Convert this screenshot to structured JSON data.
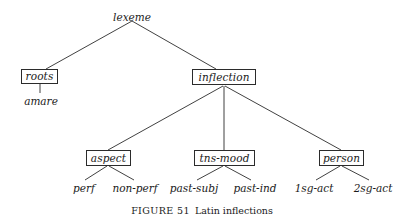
{
  "figure": {
    "caption_label": "FIGURE 51",
    "caption_title": "Latin inflections",
    "line_color": "#2b2b2b",
    "text_color": "#1a1a1a",
    "background": "#ffffff"
  },
  "tree": {
    "root": {
      "label": "lexeme",
      "x": 132,
      "y": 12
    },
    "boxes": [
      {
        "label": "roots",
        "x": 21,
        "y": 69,
        "w": 37,
        "h": 15
      },
      {
        "label": "inflection",
        "x": 192,
        "y": 69,
        "w": 64,
        "h": 16
      },
      {
        "label": "aspect",
        "x": 86,
        "y": 150,
        "w": 45,
        "h": 16
      },
      {
        "label": "tns-mood",
        "x": 194,
        "y": 150,
        "w": 61,
        "h": 16
      },
      {
        "label": "person",
        "x": 319,
        "y": 150,
        "w": 45,
        "h": 16
      }
    ],
    "leaves": [
      {
        "label": "amare",
        "x": 41,
        "y": 96
      },
      {
        "label": "perf",
        "x": 84,
        "y": 183
      },
      {
        "label": "non-perf",
        "x": 135,
        "y": 183
      },
      {
        "label": "past-subj",
        "x": 194,
        "y": 183
      },
      {
        "label": "past-ind",
        "x": 255,
        "y": 183
      },
      {
        "label": "1sg-act",
        "x": 314,
        "y": 183
      },
      {
        "label": "2sg-act",
        "x": 373,
        "y": 183
      }
    ],
    "edges": [
      {
        "from": "lexeme",
        "to": "roots",
        "x1": 132,
        "y1": 21,
        "x2": 46,
        "y2": 69
      },
      {
        "from": "lexeme",
        "to": "inflection",
        "x1": 132,
        "y1": 21,
        "x2": 216,
        "y2": 69
      },
      {
        "from": "roots",
        "to": "amare",
        "x1": 40,
        "y1": 84,
        "x2": 40,
        "y2": 93
      },
      {
        "from": "inflection",
        "to": "aspect",
        "x1": 223,
        "y1": 86,
        "x2": 108,
        "y2": 150
      },
      {
        "from": "inflection",
        "to": "tns-mood",
        "x1": 224,
        "y1": 86,
        "x2": 224,
        "y2": 150
      },
      {
        "from": "inflection",
        "to": "person",
        "x1": 225,
        "y1": 86,
        "x2": 341,
        "y2": 150
      },
      {
        "from": "aspect",
        "to": "perf",
        "x1": 107,
        "y1": 166,
        "x2": 85,
        "y2": 180
      },
      {
        "from": "aspect",
        "to": "non-perf",
        "x1": 109,
        "y1": 166,
        "x2": 134,
        "y2": 180
      },
      {
        "from": "tns-mood",
        "to": "past-subj",
        "x1": 223,
        "y1": 166,
        "x2": 197,
        "y2": 180
      },
      {
        "from": "tns-mood",
        "to": "past-ind",
        "x1": 225,
        "y1": 166,
        "x2": 251,
        "y2": 180
      },
      {
        "from": "person",
        "to": "1sg-act",
        "x1": 340,
        "y1": 166,
        "x2": 316,
        "y2": 180
      },
      {
        "from": "person",
        "to": "2sg-act",
        "x1": 342,
        "y1": 166,
        "x2": 369,
        "y2": 180
      }
    ]
  },
  "caption_position": {
    "y": 206
  }
}
